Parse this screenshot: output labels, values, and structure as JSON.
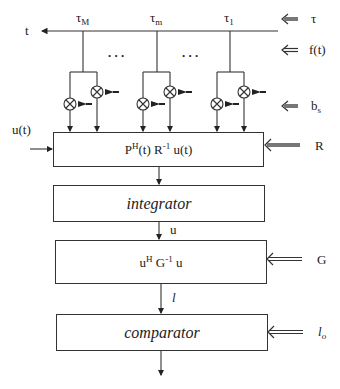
{
  "diagram": {
    "top_bus": {
      "output_label": "t"
    },
    "taps": [
      {
        "label": "τ",
        "sub": "M"
      },
      {
        "label": "τ",
        "sub": "m"
      },
      {
        "label": "τ",
        "sub": "1"
      }
    ],
    "ellipsis": ". . .",
    "right_inputs": {
      "tau": "τ",
      "f": "f(t)",
      "b": "b",
      "b_sub": "s",
      "R": "R",
      "G": "G",
      "l0": "l",
      "l0_sub": "o"
    },
    "left_input": "u(t)",
    "blocks": {
      "correlator": {
        "p": "P",
        "p_sup": "H",
        "mid": "(t) R",
        "mid_sup": "-1",
        "end": " u(t)"
      },
      "integrator": "integrator",
      "quadratic": {
        "u": "u",
        "u_sup": "H",
        "g": " G",
        "g_sup": "-1",
        "end": " u"
      },
      "comparator": "comparator"
    },
    "edges": {
      "integrator_out": "u",
      "quadratic_out": "l"
    }
  }
}
